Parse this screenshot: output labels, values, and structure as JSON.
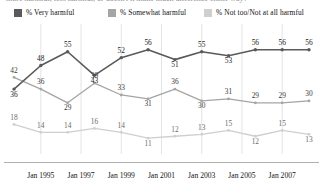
{
  "title_strip": {
    "text": "more harmful, less harmful, or doesn't it make much difference either way?"
  },
  "legend": {
    "items": [
      {
        "label": "% Very harmful",
        "color": "#5a5a5a",
        "icon": "legend-swatch"
      },
      {
        "label": "% Somewhat harmful",
        "color": "#a5a5a5",
        "icon": "legend-swatch"
      },
      {
        "label": "% Not too/Not at all harmful",
        "color": "#cfcfcf",
        "icon": "legend-swatch"
      }
    ]
  },
  "chart_data": {
    "type": "line",
    "title": "",
    "subtitle": "",
    "xlabel": "",
    "ylabel": "",
    "ylim": [
      5,
      62
    ],
    "grid": true,
    "legend_position": "top",
    "x_tick_labels": [
      "Jan 1995",
      "Jan 1997",
      "Jan 1999",
      "Jan 2001",
      "Jan 2003",
      "Jan 2005",
      "Jan 2007"
    ],
    "x_tick_indices": [
      1,
      2.5,
      4,
      5.5,
      7,
      8.5,
      10
    ],
    "n_points": 12,
    "series": [
      {
        "name": "% Very harmful",
        "color": "#5a5a5a",
        "values": [
          36,
          48,
          55,
          43,
          52,
          56,
          51,
          55,
          53,
          56,
          56,
          56
        ]
      },
      {
        "name": "% Somewhat harmful",
        "color": "#a5a5a5",
        "values": [
          42,
          36,
          29,
          39,
          33,
          31,
          36,
          30,
          31,
          29,
          29,
          30
        ]
      },
      {
        "name": "% Not too/Not at all harmful",
        "color": "#cfcfcf",
        "values": [
          18,
          14,
          14,
          16,
          14,
          11,
          12,
          13,
          15,
          12,
          15,
          13
        ]
      }
    ]
  }
}
